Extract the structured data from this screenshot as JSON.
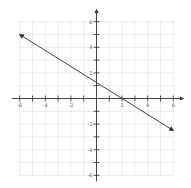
{
  "chart_data": {
    "type": "line",
    "title": "",
    "xlabel": "",
    "ylabel": "",
    "xlim": [
      -6,
      6
    ],
    "ylim": [
      -6,
      6
    ],
    "grid": true,
    "x_ticks": [
      -6,
      -5,
      -4,
      -3,
      -2,
      -1,
      0,
      1,
      2,
      3,
      4,
      5,
      6
    ],
    "x_tick_labels": [
      "-6",
      "-4",
      "-2",
      "2",
      "4",
      "6"
    ],
    "y_tick_labels": [
      "6",
      "4",
      "2",
      "-2",
      "-4",
      "-6"
    ],
    "series": [
      {
        "name": "line",
        "equation": "y = -5/8 x + 5/4",
        "x": [
          -6,
          6
        ],
        "y": [
          5,
          -2.5
        ],
        "arrows_both_ends": true,
        "x_intercept": 2,
        "y_intercept": 1.25
      }
    ],
    "colors": {
      "line": "#444444",
      "axis": "#333333",
      "grid": "#dddddd"
    }
  }
}
